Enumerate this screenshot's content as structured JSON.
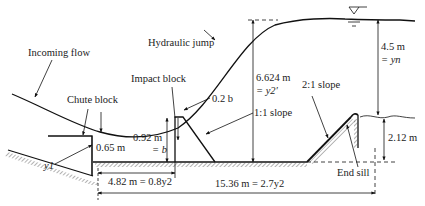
{
  "figure": {
    "labels": {
      "incoming_flow": "Incoming flow",
      "hydraulic_jump": "Hydraulic jump",
      "chute_block": "Chute block",
      "impact_block": "Impact block",
      "impact_block_top": "0.2 b",
      "slope_1_1": "1:1 slope",
      "slope_2_1": "2:1 slope",
      "end_sill": "End sill",
      "y1": "y1"
    },
    "dimensions": {
      "chute_block_height": "0.65 m",
      "impact_block_height_line1": "0.92 m",
      "impact_block_height_line2": "= b",
      "sequent_depth_line1": "6.624 m",
      "sequent_depth_line2": "= y2′",
      "tailwater_depth_line1": "4.5 m",
      "tailwater_depth_line2": "= yn",
      "end_sill_height": "2.12 m",
      "impact_block_distance": "4.82 m = 0.8y2",
      "basin_length": "15.36 m = 2.7y2"
    },
    "symbols": {
      "water_surface": "water-level-triangle"
    }
  }
}
